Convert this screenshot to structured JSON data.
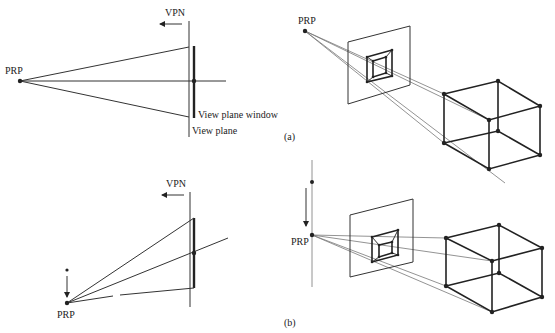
{
  "panels": {
    "a": {
      "caption": "(a)",
      "side_view": {
        "vpn_label": "VPN",
        "prp_label": "PRP",
        "window_label": "View plane window",
        "plane_label": "View plane"
      },
      "perspective_view": {
        "prp_label": "PRP"
      }
    },
    "b": {
      "caption": "(b)",
      "side_view": {
        "vpn_label": "VPN",
        "prp_label": "PRP"
      },
      "perspective_view": {
        "prp_label": "PRP"
      }
    }
  },
  "colors": {
    "ink": "#222222",
    "projector": "#777777",
    "background": "#ffffff"
  }
}
